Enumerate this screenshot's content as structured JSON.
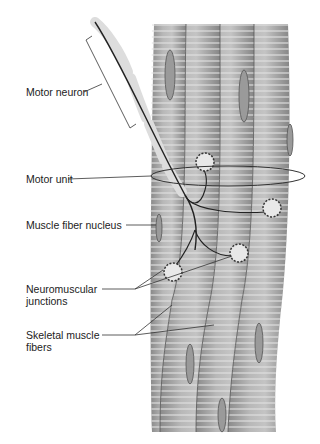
{
  "colors": {
    "fiber": "#a9a9a9",
    "fiber_light": "#d0d0d0",
    "fiber_dark": "#7c7c7c",
    "leader": "#333333",
    "label_text": "#222222"
  },
  "labels": {
    "motor_neuron": "Motor neuron",
    "motor_unit": "Motor unit",
    "muscle_fiber_nucleus": "Muscle fiber nucleus",
    "neuromuscular_junctions": "Neuromuscular\njunctions",
    "skeletal_muscle_fibers": "Skeletal muscle\nfibers"
  }
}
